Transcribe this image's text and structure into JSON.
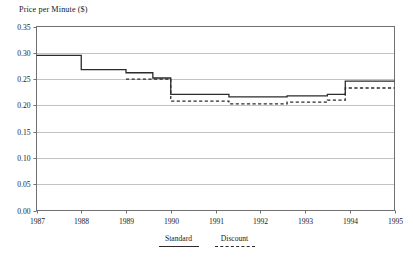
{
  "chart_data": {
    "type": "line",
    "title": "",
    "ylabel": "Price per Minute ($)",
    "xlabel": "",
    "ylim": [
      0.0,
      0.35
    ],
    "xlim": [
      1987,
      1995
    ],
    "grid": true,
    "legend_position": "bottom",
    "y_ticks": [
      "0.00",
      "0.05",
      "0.10",
      "0.15",
      "0.20",
      "0.25",
      "0.30",
      "0.35"
    ],
    "y_tick_values": [
      0.0,
      0.05,
      0.1,
      0.15,
      0.2,
      0.25,
      0.3,
      0.35
    ],
    "x_ticks": [
      "1987",
      "1988",
      "1989",
      "1990",
      "1991",
      "1992",
      "1993",
      "1994",
      "1995"
    ],
    "x_tick_values": [
      1987,
      1988,
      1989,
      1990,
      1991,
      1992,
      1993,
      1994,
      1995
    ],
    "step_style": "post",
    "series": [
      {
        "name": "Standard",
        "style": "solid",
        "color": "#2b2b2b",
        "x": [
          1987.0,
          1988.0,
          1989.0,
          1989.6,
          1990.0,
          1991.3,
          1992.6,
          1993.5,
          1993.9,
          1995.0
        ],
        "values": [
          0.295,
          0.268,
          0.262,
          0.252,
          0.221,
          0.216,
          0.218,
          0.221,
          0.246,
          0.246
        ]
      },
      {
        "name": "Discount",
        "style": "dashed",
        "color": "#2b2b2b",
        "x": [
          1989.0,
          1989.6,
          1990.0,
          1991.3,
          1992.6,
          1993.5,
          1993.9,
          1995.0
        ],
        "values": [
          0.25,
          0.25,
          0.208,
          0.203,
          0.206,
          0.21,
          0.233,
          0.233
        ]
      }
    ]
  },
  "legend": {
    "entries": [
      {
        "label": "Standard",
        "style": "solid"
      },
      {
        "label": "Discount",
        "style": "dashed"
      }
    ]
  }
}
